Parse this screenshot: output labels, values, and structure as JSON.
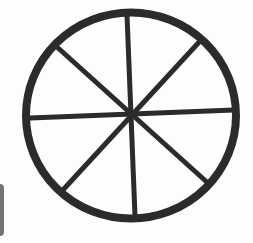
{
  "image": {
    "subject": "eight-spoked wheel",
    "colors": {
      "background": "#fdfdfd",
      "wheel": "#2b2b2b",
      "edge_bar": "#5a5a5a"
    },
    "wheel": {
      "center": [
        131,
        115
      ],
      "radius": 105,
      "rim_width": 8,
      "spoke_width": 5,
      "spoke_count": 8
    }
  }
}
